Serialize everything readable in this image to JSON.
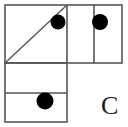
{
  "figure": {
    "label": "C",
    "label_position": {
      "x": 101,
      "y": 93
    },
    "canvas": {
      "width": 128,
      "height": 127,
      "background": "#ffffff"
    },
    "stroke_color": "#555555",
    "stroke_width": 1.6,
    "dot_color": "#000000",
    "shapes": {
      "outer_top_rect": {
        "name": "top-rectangle",
        "x": 5,
        "y": 5,
        "width": 117,
        "height": 58
      },
      "upper_left_square": {
        "name": "upper-left-square",
        "x": 5,
        "y": 5,
        "width": 62,
        "height": 58
      },
      "diagonal": {
        "name": "diagonal-line",
        "x1": 5,
        "y1": 63,
        "x2": 67,
        "y2": 5
      },
      "vertical_divider_1": {
        "name": "vertical-divider-mid",
        "x": 67,
        "y1": 5,
        "y2": 63
      },
      "vertical_divider_2": {
        "name": "vertical-divider-right",
        "x": 94,
        "y1": 5,
        "y2": 63
      },
      "lower_left_rect": {
        "name": "lower-left-rectangle",
        "x": 5,
        "y": 63,
        "width": 62,
        "height": 59
      },
      "horizontal_divider": {
        "name": "horizontal-divider-lower",
        "x1": 5,
        "x2": 67,
        "y": 93
      }
    },
    "dots": [
      {
        "name": "dot-upper-left-square",
        "cx": 58,
        "cy": 22,
        "r": 7.5
      },
      {
        "name": "dot-upper-right-cell",
        "cx": 100,
        "cy": 22,
        "r": 8
      },
      {
        "name": "dot-lower-left-cell",
        "cx": 45,
        "cy": 101,
        "r": 8.5
      }
    ]
  }
}
